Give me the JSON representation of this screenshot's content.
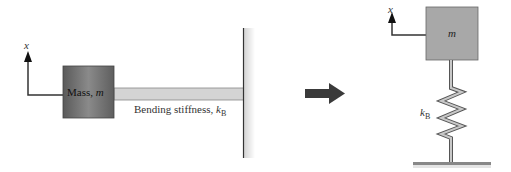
{
  "left": {
    "axis_label": "x",
    "mass_label": "Mass, ",
    "mass_symbol": "m",
    "beam_label": "Bending stiffness, ",
    "stiffness_symbol": "k",
    "stiffness_subscript": "B"
  },
  "right": {
    "axis_label": "x",
    "mass_symbol": "m",
    "stiffness_symbol": "k",
    "stiffness_subscript": "B"
  },
  "colors": {
    "mass_left": "#6e6e6e",
    "mass_right": "#a8a8a8",
    "beam": "#d4d4d4",
    "arrow": "#3a3a3a",
    "line": "#333333"
  }
}
